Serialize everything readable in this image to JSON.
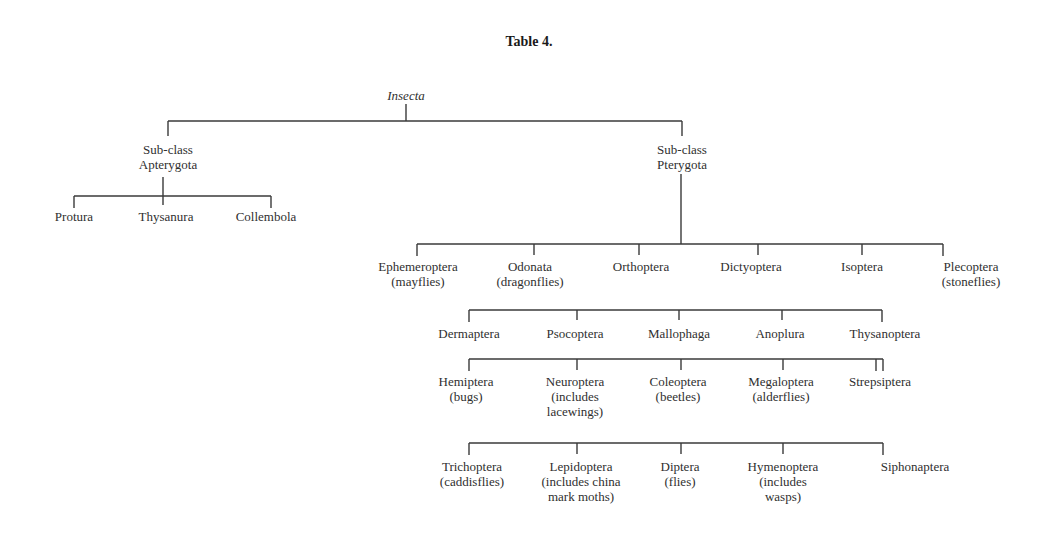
{
  "title": "Table 4.",
  "root": "Insecta",
  "subclasses": [
    {
      "label_line1": "Sub-class",
      "label_line2": "Apterygota"
    },
    {
      "label_line1": "Sub-class",
      "label_line2": "Pterygota"
    }
  ],
  "apterygota_orders": [
    "Protura",
    "Thysanura",
    "Collembola"
  ],
  "pterygota_rows": [
    [
      {
        "name": "Ephemeroptera",
        "common": "(mayflies)"
      },
      {
        "name": "Odonata",
        "common": "(dragonflies)"
      },
      {
        "name": "Orthoptera",
        "common": ""
      },
      {
        "name": "Dictyoptera",
        "common": ""
      },
      {
        "name": "Isoptera",
        "common": ""
      },
      {
        "name": "Plecoptera",
        "common": "(stoneflies)"
      }
    ],
    [
      {
        "name": "Dermaptera"
      },
      {
        "name": "Psocoptera"
      },
      {
        "name": "Mallophaga"
      },
      {
        "name": "Anoplura"
      },
      {
        "name": "Thysanoptera"
      }
    ],
    [
      {
        "name": "Hemiptera",
        "common1": "(bugs)",
        "common2": ""
      },
      {
        "name": "Neuroptera",
        "common1": "(includes",
        "common2": "lacewings)"
      },
      {
        "name": "Coleoptera",
        "common1": "(beetles)",
        "common2": ""
      },
      {
        "name": "Megaloptera",
        "common1": "(alderflies)",
        "common2": ""
      },
      {
        "name": "Strepsiptera",
        "common1": "",
        "common2": ""
      }
    ],
    [
      {
        "name": "Trichoptera",
        "common1": "(caddisflies)",
        "common2": ""
      },
      {
        "name": "Lepidoptera",
        "common1": "(includes china",
        "common2": "mark moths)"
      },
      {
        "name": "Diptera",
        "common1": "(flies)",
        "common2": ""
      },
      {
        "name": "Hymenoptera",
        "common1": "(includes",
        "common2": "wasps)"
      },
      {
        "name": "Siphonaptera",
        "common1": "",
        "common2": ""
      }
    ]
  ]
}
